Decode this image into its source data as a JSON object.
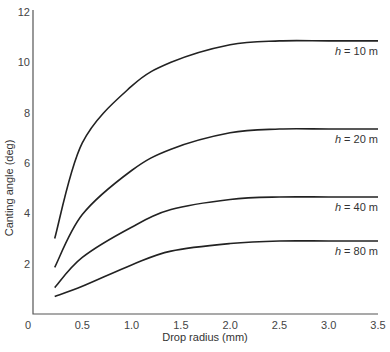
{
  "chart_data": {
    "type": "line",
    "title": "",
    "xlabel": "Drop radius (mm)",
    "ylabel": "Canting angle (deg)",
    "xlim": [
      0,
      3.5
    ],
    "ylim": [
      0,
      12
    ],
    "grid": false,
    "legend": "inline labels at right end of curves",
    "x_ticks": [
      "0",
      "0.5",
      "1.0",
      "1.5",
      "2.0",
      "2.5",
      "3.0",
      "3.5"
    ],
    "y_ticks": [
      "2",
      "4",
      "6",
      "8",
      "10",
      "12"
    ],
    "x_tick_values": [
      0,
      0.5,
      1.0,
      1.5,
      2.0,
      2.5,
      3.0,
      3.5
    ],
    "y_tick_values": [
      2,
      4,
      6,
      8,
      10,
      12
    ],
    "x": [
      0.22,
      0.5,
      1.0,
      1.4,
      2.0,
      2.5,
      3.0,
      3.5
    ],
    "series": [
      {
        "name": "h = 10 m",
        "label_var": "h",
        "label_rest": " = 10 m",
        "values": [
          3.0,
          6.8,
          9.05,
          10.0,
          10.7,
          10.85,
          10.85,
          10.85
        ]
      },
      {
        "name": "h = 20 m",
        "label_var": "h",
        "label_rest": " = 20 m",
        "values": [
          1.85,
          3.95,
          5.7,
          6.55,
          7.2,
          7.35,
          7.35,
          7.35
        ]
      },
      {
        "name": "h = 40 m",
        "label_var": "h",
        "label_rest": " = 40 m",
        "values": [
          1.05,
          2.25,
          3.45,
          4.15,
          4.55,
          4.65,
          4.65,
          4.65
        ]
      },
      {
        "name": "h = 80 m",
        "label_var": "h",
        "label_rest": " = 80 m",
        "values": [
          0.7,
          1.1,
          1.95,
          2.5,
          2.8,
          2.9,
          2.9,
          2.9
        ]
      }
    ]
  }
}
